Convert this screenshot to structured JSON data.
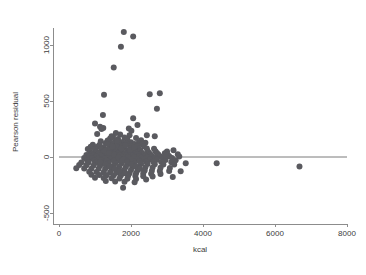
{
  "chart_data": {
    "type": "scatter",
    "title": "",
    "xlabel": "kcal",
    "ylabel": "Pearson residual",
    "xlim": [
      0,
      8000
    ],
    "ylim": [
      -500,
      1150
    ],
    "xticks": [
      0,
      2000,
      4000,
      6000,
      8000
    ],
    "xtick_labels": [
      "0",
      "2000",
      "4000",
      "6000",
      "8000"
    ],
    "yticks": [
      -500,
      0,
      500,
      1000
    ],
    "ytick_labels": [
      "-500",
      "0",
      "500",
      "1000"
    ],
    "grid": false,
    "legend": "none",
    "point_color": "#5a5a5f",
    "point_size": 3,
    "reference_line": {
      "type": "horizontal",
      "y": 0,
      "x_from": 0,
      "x_to": 8000,
      "color": "#7a7a7a"
    },
    "series": [
      {
        "name": "Pearson residual vs kcal",
        "points": [
          [
            1800,
            1115
          ],
          [
            2060,
            1075
          ],
          [
            1720,
            985
          ],
          [
            1520,
            800
          ],
          [
            1250,
            555
          ],
          [
            2520,
            560
          ],
          [
            2800,
            570
          ],
          [
            2720,
            430
          ],
          [
            1220,
            375
          ],
          [
            2060,
            345
          ],
          [
            1000,
            300
          ],
          [
            1140,
            270
          ],
          [
            1230,
            260
          ],
          [
            1180,
            250
          ],
          [
            2010,
            235
          ],
          [
            1060,
            205
          ],
          [
            1700,
            200
          ],
          [
            1960,
            195
          ],
          [
            2440,
            195
          ],
          [
            2660,
            185
          ],
          [
            1500,
            180
          ],
          [
            1820,
            175
          ],
          [
            2140,
            170
          ],
          [
            1420,
            165
          ],
          [
            1640,
            160
          ],
          [
            1900,
            155
          ],
          [
            2280,
            150
          ],
          [
            1350,
            148
          ],
          [
            1160,
            140
          ],
          [
            1560,
            138
          ],
          [
            1760,
            135
          ],
          [
            2000,
            132
          ],
          [
            2220,
            130
          ],
          [
            2400,
            128
          ],
          [
            1300,
            125
          ],
          [
            1480,
            122
          ],
          [
            1660,
            120
          ],
          [
            1880,
            118
          ],
          [
            2100,
            115
          ],
          [
            2320,
            112
          ],
          [
            940,
            110
          ],
          [
            1120,
            108
          ],
          [
            1400,
            105
          ],
          [
            1600,
            103
          ],
          [
            1780,
            100
          ],
          [
            1990,
            98
          ],
          [
            2180,
            96
          ],
          [
            2360,
            94
          ],
          [
            880,
            92
          ],
          [
            1050,
            90
          ],
          [
            1230,
            88
          ],
          [
            1440,
            86
          ],
          [
            1620,
            84
          ],
          [
            1810,
            82
          ],
          [
            2010,
            80
          ],
          [
            2200,
            78
          ],
          [
            2440,
            76
          ],
          [
            2640,
            74
          ],
          [
            800,
            72
          ],
          [
            1000,
            70
          ],
          [
            1180,
            68
          ],
          [
            1360,
            66
          ],
          [
            1540,
            64
          ],
          [
            1720,
            62
          ],
          [
            1900,
            60
          ],
          [
            2080,
            58
          ],
          [
            2260,
            56
          ],
          [
            2460,
            54
          ],
          [
            2680,
            52
          ],
          [
            3000,
            50
          ],
          [
            860,
            48
          ],
          [
            1040,
            46
          ],
          [
            1220,
            45
          ],
          [
            1400,
            44
          ],
          [
            1580,
            43
          ],
          [
            1760,
            42
          ],
          [
            1940,
            41
          ],
          [
            2120,
            40
          ],
          [
            2300,
            39
          ],
          [
            2500,
            38
          ],
          [
            2720,
            36
          ],
          [
            2940,
            34
          ],
          [
            3180,
            60
          ],
          [
            920,
            32
          ],
          [
            1100,
            31
          ],
          [
            1280,
            30
          ],
          [
            1460,
            29
          ],
          [
            1640,
            28
          ],
          [
            1820,
            27
          ],
          [
            2000,
            26
          ],
          [
            2180,
            25
          ],
          [
            2360,
            24
          ],
          [
            2540,
            23
          ],
          [
            2760,
            22
          ],
          [
            3020,
            20
          ],
          [
            760,
            18
          ],
          [
            960,
            17
          ],
          [
            1140,
            16
          ],
          [
            1320,
            15
          ],
          [
            1500,
            14
          ],
          [
            1680,
            13
          ],
          [
            1860,
            12
          ],
          [
            2040,
            11
          ],
          [
            2220,
            10
          ],
          [
            2400,
            9
          ],
          [
            2580,
            8
          ],
          [
            2800,
            7
          ],
          [
            3060,
            6
          ],
          [
            3340,
            5
          ],
          [
            840,
            4
          ],
          [
            1020,
            3
          ],
          [
            1200,
            2
          ],
          [
            1380,
            1
          ],
          [
            1560,
            0
          ],
          [
            1740,
            -1
          ],
          [
            1920,
            -2
          ],
          [
            2100,
            -3
          ],
          [
            2280,
            -4
          ],
          [
            2460,
            -5
          ],
          [
            2660,
            -6
          ],
          [
            2880,
            -7
          ],
          [
            3140,
            -8
          ],
          [
            700,
            -10
          ],
          [
            900,
            -12
          ],
          [
            1080,
            -14
          ],
          [
            1260,
            -15
          ],
          [
            1440,
            -16
          ],
          [
            1620,
            -17
          ],
          [
            1800,
            -18
          ],
          [
            1980,
            -19
          ],
          [
            2160,
            -20
          ],
          [
            2340,
            -21
          ],
          [
            2520,
            -22
          ],
          [
            2720,
            -24
          ],
          [
            2960,
            -26
          ],
          [
            3240,
            -28
          ],
          [
            780,
            -30
          ],
          [
            980,
            -31
          ],
          [
            1160,
            -32
          ],
          [
            1340,
            -33
          ],
          [
            1520,
            -34
          ],
          [
            1700,
            -35
          ],
          [
            1880,
            -36
          ],
          [
            2060,
            -37
          ],
          [
            2240,
            -38
          ],
          [
            2420,
            -40
          ],
          [
            2620,
            -42
          ],
          [
            2840,
            -44
          ],
          [
            3120,
            -46
          ],
          [
            620,
            -48
          ],
          [
            820,
            -50
          ],
          [
            1020,
            -52
          ],
          [
            1200,
            -53
          ],
          [
            1380,
            -54
          ],
          [
            1560,
            -55
          ],
          [
            1740,
            -56
          ],
          [
            1920,
            -57
          ],
          [
            2100,
            -58
          ],
          [
            2280,
            -60
          ],
          [
            2460,
            -62
          ],
          [
            2660,
            -64
          ],
          [
            2900,
            -66
          ],
          [
            3200,
            -68
          ],
          [
            3520,
            -55
          ],
          [
            560,
            -72
          ],
          [
            760,
            -74
          ],
          [
            960,
            -76
          ],
          [
            1140,
            -78
          ],
          [
            1320,
            -80
          ],
          [
            1500,
            -82
          ],
          [
            1680,
            -84
          ],
          [
            1860,
            -86
          ],
          [
            2040,
            -88
          ],
          [
            2220,
            -90
          ],
          [
            2400,
            -92
          ],
          [
            2600,
            -94
          ],
          [
            2820,
            -96
          ],
          [
            3080,
            -98
          ],
          [
            480,
            -100
          ],
          [
            700,
            -102
          ],
          [
            900,
            -104
          ],
          [
            1100,
            -106
          ],
          [
            1280,
            -108
          ],
          [
            1460,
            -110
          ],
          [
            1640,
            -112
          ],
          [
            1820,
            -114
          ],
          [
            2000,
            -116
          ],
          [
            2180,
            -118
          ],
          [
            2380,
            -120
          ],
          [
            2580,
            -122
          ],
          [
            2800,
            -124
          ],
          [
            3060,
            -126
          ],
          [
            3380,
            -128
          ],
          [
            840,
            -132
          ],
          [
            1040,
            -134
          ],
          [
            1240,
            -136
          ],
          [
            1420,
            -138
          ],
          [
            1600,
            -140
          ],
          [
            1780,
            -142
          ],
          [
            1960,
            -144
          ],
          [
            2140,
            -146
          ],
          [
            2340,
            -148
          ],
          [
            2560,
            -150
          ],
          [
            2820,
            -152
          ],
          [
            900,
            -158
          ],
          [
            1120,
            -160
          ],
          [
            1320,
            -162
          ],
          [
            1520,
            -164
          ],
          [
            1720,
            -166
          ],
          [
            1920,
            -168
          ],
          [
            2120,
            -170
          ],
          [
            2340,
            -172
          ],
          [
            2600,
            -174
          ],
          [
            3160,
            -178
          ],
          [
            1000,
            -185
          ],
          [
            1240,
            -188
          ],
          [
            1460,
            -190
          ],
          [
            1680,
            -192
          ],
          [
            1900,
            -194
          ],
          [
            2140,
            -196
          ],
          [
            2420,
            -200
          ],
          [
            1300,
            -215
          ],
          [
            1560,
            -218
          ],
          [
            1820,
            -222
          ],
          [
            2100,
            -226
          ],
          [
            1780,
            -275
          ],
          [
            4380,
            -55
          ],
          [
            6680,
            -85
          ],
          [
            1350,
            115
          ],
          [
            1490,
            95
          ],
          [
            1610,
            145
          ],
          [
            1730,
            75
          ],
          [
            1850,
            105
          ],
          [
            1970,
            62
          ],
          [
            2090,
            88
          ],
          [
            1270,
            55
          ],
          [
            1390,
            35
          ],
          [
            1530,
            20
          ],
          [
            1650,
            -5
          ],
          [
            1770,
            -25
          ],
          [
            1890,
            -45
          ],
          [
            2010,
            -65
          ],
          [
            2130,
            -85
          ],
          [
            2250,
            -105
          ],
          [
            1150,
            -45
          ],
          [
            1290,
            -65
          ],
          [
            1410,
            -85
          ],
          [
            1550,
            -105
          ],
          [
            1690,
            -125
          ],
          [
            1830,
            -145
          ],
          [
            2970,
            15
          ],
          [
            3300,
            25
          ],
          [
            1460,
            185
          ],
          [
            1580,
            215
          ],
          [
            1940,
            255
          ],
          [
            2180,
            285
          ]
        ]
      }
    ]
  },
  "axis": {
    "x_title": "kcal",
    "y_title": "Pearson residual"
  }
}
